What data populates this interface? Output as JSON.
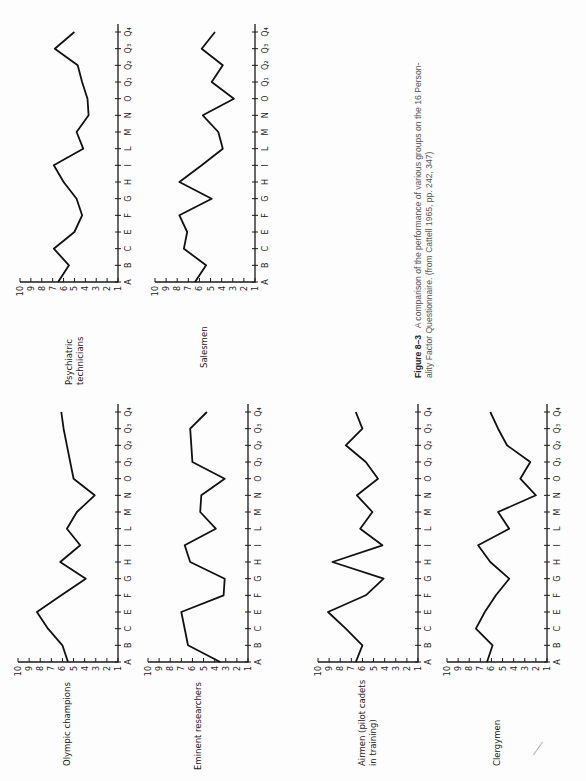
{
  "figure": {
    "number": "Figure 8–3",
    "caption_line1": "A comparison of the performance of various groups on the 16 Person-",
    "caption_line2": "ality Factor Questionnaire. (from Cattell 1965, pp. 242, 347)"
  },
  "chart_data": [
    {
      "type": "line",
      "title": "Psychiatric technicians",
      "categories": [
        "A",
        "B",
        "C",
        "E",
        "F",
        "G",
        "H",
        "I",
        "L",
        "M",
        "N",
        "O",
        "Q1",
        "Q2",
        "Q3",
        "Q4"
      ],
      "values": [
        6.5,
        5.5,
        6.9,
        5.0,
        4.3,
        4.8,
        6.0,
        6.9,
        4.2,
        4.8,
        3.7,
        3.8,
        4.3,
        4.7,
        6.8,
        5.0
      ],
      "xlabel": "",
      "ylabel": "",
      "ylim": [
        1,
        10
      ],
      "grid": false,
      "orientation": "rotated-90"
    },
    {
      "type": "line",
      "title": "Salesmen",
      "categories": [
        "A",
        "B",
        "C",
        "E",
        "F",
        "G",
        "H",
        "I",
        "L",
        "M",
        "N",
        "O",
        "Q1",
        "Q2",
        "Q3",
        "Q4"
      ],
      "values": [
        6.4,
        5.4,
        7.4,
        7.1,
        7.8,
        4.9,
        7.8,
        5.8,
        3.9,
        4.3,
        5.7,
        2.9,
        4.9,
        3.9,
        5.8,
        4.6
      ],
      "xlabel": "",
      "ylabel": "",
      "ylim": [
        1,
        10
      ],
      "grid": false,
      "orientation": "rotated-90"
    },
    {
      "type": "line",
      "title": "Olympic champions",
      "categories": [
        "A",
        "B",
        "C",
        "E",
        "F",
        "G",
        "H",
        "I",
        "L",
        "M",
        "N",
        "O",
        "Q1",
        "Q2",
        "Q3",
        "Q4"
      ],
      "values": [
        5.5,
        6.0,
        7.3,
        8.3,
        6.1,
        3.9,
        6.2,
        4.4,
        5.6,
        4.7,
        3.1,
        5.0,
        5.3,
        5.6,
        5.9,
        6.1
      ],
      "xlabel": "",
      "ylabel": "",
      "ylim": [
        1,
        10
      ],
      "grid": false,
      "orientation": "rotated-90"
    },
    {
      "type": "line",
      "title": "Eminent researchers",
      "categories": [
        "A",
        "B",
        "C",
        "E",
        "F",
        "G",
        "H",
        "I",
        "L",
        "M",
        "N",
        "O",
        "Q1",
        "Q2",
        "Q3",
        "Q4"
      ],
      "values": [
        3.5,
        6.4,
        6.7,
        7.0,
        3.2,
        3.1,
        6.2,
        6.7,
        3.9,
        5.3,
        5.2,
        3.1,
        6.0,
        6.1,
        6.2,
        4.7
      ],
      "xlabel": "",
      "ylabel": "",
      "ylim": [
        1,
        10
      ],
      "grid": false,
      "orientation": "rotated-90"
    },
    {
      "type": "line",
      "title": "Airmen (pilot cadets in training)",
      "categories": [
        "A",
        "B",
        "C",
        "E",
        "F",
        "G",
        "H",
        "I",
        "L",
        "M",
        "N",
        "O",
        "Q1",
        "Q2",
        "Q3",
        "Q4"
      ],
      "values": [
        6.6,
        6.0,
        7.5,
        9.1,
        5.7,
        4.1,
        8.7,
        4.2,
        6.2,
        5.1,
        6.5,
        4.6,
        5.7,
        7.5,
        6.0,
        6.6
      ],
      "xlabel": "",
      "ylabel": "",
      "ylim": [
        1,
        10
      ],
      "grid": false,
      "orientation": "rotated-90"
    },
    {
      "type": "line",
      "title": "Clergymen",
      "categories": [
        "A",
        "B",
        "C",
        "E",
        "F",
        "G",
        "H",
        "I",
        "L",
        "M",
        "N",
        "O",
        "Q1",
        "Q2",
        "Q3",
        "Q4"
      ],
      "values": [
        6.4,
        5.9,
        7.4,
        6.6,
        5.6,
        4.4,
        6.1,
        7.2,
        4.4,
        5.4,
        2.0,
        3.4,
        2.5,
        4.6,
        5.4,
        6.1
      ],
      "xlabel": "",
      "ylabel": "",
      "ylim": [
        1,
        10
      ],
      "grid": false,
      "orientation": "rotated-90"
    }
  ],
  "panels": [
    {
      "label_lines": [
        "Psychiatric",
        "technicians"
      ],
      "x10": 20,
      "x1": 118,
      "yA": 282,
      "yQ4": 32,
      "label_x": 64,
      "label_y": 385
    },
    {
      "label_lines": [
        "Salesmen"
      ],
      "x10": 155,
      "x1": 255,
      "yA": 282,
      "yQ4": 32,
      "label_x": 199,
      "label_y": 368
    },
    {
      "label_lines": [
        "Olympic champions"
      ],
      "x10": 18,
      "x1": 118,
      "yA": 662,
      "yQ4": 412,
      "label_x": 62,
      "label_y": 766
    },
    {
      "label_lines": [
        "Eminent researchers"
      ],
      "x10": 148,
      "x1": 248,
      "yA": 662,
      "yQ4": 412,
      "label_x": 193,
      "label_y": 770
    },
    {
      "label_lines": [
        "Airmen (pilot cadets",
        "in training)"
      ],
      "x10": 318,
      "x1": 418,
      "yA": 662,
      "yQ4": 412,
      "label_x": 357,
      "label_y": 766
    },
    {
      "label_lines": [
        "Clergymen"
      ],
      "x10": 447,
      "x1": 547,
      "yA": 662,
      "yQ4": 412,
      "label_x": 492,
      "label_y": 766
    }
  ],
  "axis": {
    "value_ticks": [
      "10",
      "9",
      "8",
      "7",
      "6",
      "5",
      "4",
      "3",
      "2",
      "1"
    ],
    "category_ticks": [
      "A",
      "B",
      "C",
      "E",
      "F",
      "G",
      "H",
      "I",
      "L",
      "M",
      "N",
      "O",
      "Q₁",
      "Q₂",
      "Q₃",
      "Q₄"
    ]
  }
}
